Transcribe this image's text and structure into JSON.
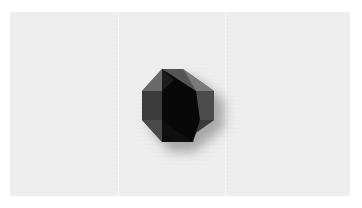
{
  "scene": {
    "description": "Dark faceted octagonal gem shape with drop shadow on a light grey textured background",
    "icon": "octagon-gem-icon",
    "colors": {
      "background": "#ffffff",
      "panel": "#ececec",
      "facet_light": "#6e6e6e",
      "facet_mid": "#4a4a4a",
      "facet_dark": "#151515",
      "core": "#050505",
      "shadow": "#9a9a9a"
    }
  }
}
